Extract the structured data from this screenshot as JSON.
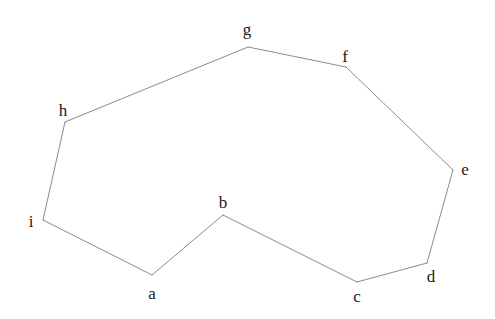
{
  "figure": {
    "type": "polygon-diagram",
    "width": 495,
    "height": 319,
    "background_color": "#ffffff",
    "edge_color": "#8c8c8c",
    "edge_width": 1,
    "label_color": "#1a1a1a",
    "label_font_size": 17,
    "closed": true
  },
  "vertices": [
    {
      "id": "a",
      "label": "a",
      "x": 152,
      "y": 275,
      "label_x": 152,
      "label_y": 293
    },
    {
      "id": "b",
      "label": "b",
      "x": 223,
      "y": 215,
      "label_x": 223,
      "label_y": 202
    },
    {
      "id": "c",
      "label": "c",
      "x": 357,
      "y": 282,
      "label_x": 357,
      "label_y": 296
    },
    {
      "id": "d",
      "label": "d",
      "x": 427,
      "y": 263,
      "label_x": 431,
      "label_y": 276
    },
    {
      "id": "e",
      "label": "e",
      "x": 453,
      "y": 170,
      "label_x": 465,
      "label_y": 169
    },
    {
      "id": "f",
      "label": "f",
      "x": 346,
      "y": 67,
      "label_x": 345,
      "label_y": 56
    },
    {
      "id": "g",
      "label": "g",
      "x": 248,
      "y": 47,
      "label_x": 247,
      "label_y": 29
    },
    {
      "id": "h",
      "label": "h",
      "x": 65,
      "y": 122,
      "label_x": 63,
      "label_y": 110
    },
    {
      "id": "i",
      "label": "i",
      "x": 43,
      "y": 220,
      "label_x": 31,
      "label_y": 221
    }
  ],
  "edges": [
    {
      "from": "a",
      "to": "b"
    },
    {
      "from": "b",
      "to": "c"
    },
    {
      "from": "c",
      "to": "d"
    },
    {
      "from": "d",
      "to": "e"
    },
    {
      "from": "e",
      "to": "f"
    },
    {
      "from": "f",
      "to": "g"
    },
    {
      "from": "g",
      "to": "h"
    },
    {
      "from": "h",
      "to": "i"
    },
    {
      "from": "i",
      "to": "a"
    }
  ],
  "chart_data": {
    "type": "scatter",
    "title": "",
    "xlabel": "",
    "ylabel": "",
    "series": [
      {
        "name": "polygon-outline",
        "points": [
          {
            "label": "a",
            "x": 152,
            "y": 275
          },
          {
            "label": "b",
            "x": 223,
            "y": 215
          },
          {
            "label": "c",
            "x": 357,
            "y": 282
          },
          {
            "label": "d",
            "x": 427,
            "y": 263
          },
          {
            "label": "e",
            "x": 453,
            "y": 170
          },
          {
            "label": "f",
            "x": 346,
            "y": 67
          },
          {
            "label": "g",
            "x": 248,
            "y": 47
          },
          {
            "label": "h",
            "x": 65,
            "y": 122
          },
          {
            "label": "i",
            "x": 43,
            "y": 220
          }
        ]
      }
    ],
    "grid": false,
    "legend": "none"
  }
}
